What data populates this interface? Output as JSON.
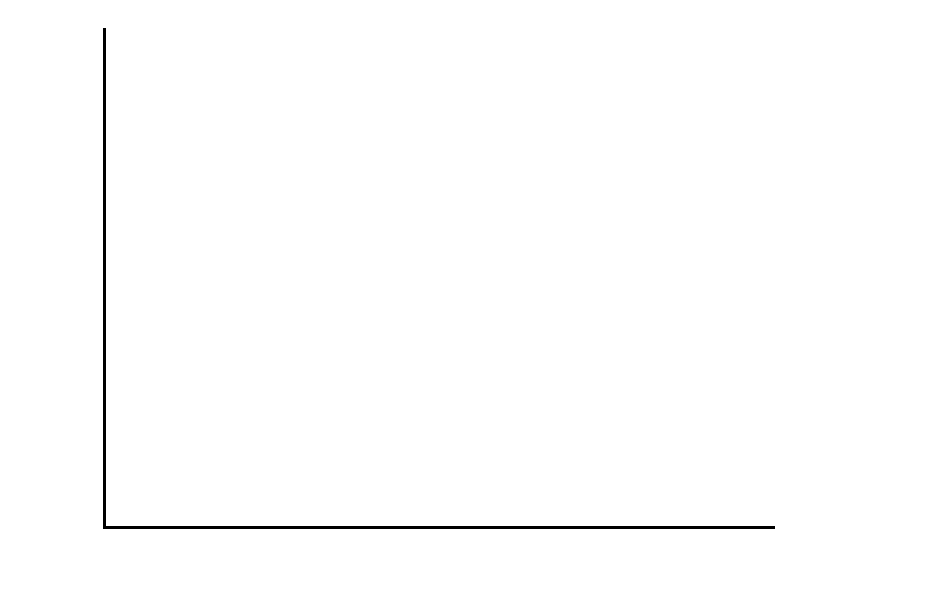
{
  "chart_data": {
    "type": "bar",
    "subtype": "stacked-vertical",
    "title": "",
    "xlabel": "Year",
    "ylabel": "",
    "categories": [
      "72",
      "73",
      "74",
      "75",
      "76",
      "77",
      "78",
      "79",
      "80",
      "81",
      "82",
      "83",
      "84",
      "85"
    ],
    "ylim": [
      0,
      600000
    ],
    "yticks": [
      0,
      100000,
      200000,
      300000,
      400000,
      500000,
      600000
    ],
    "ytick_labels": [
      "0",
      "100,000",
      "200,000",
      "300,000",
      "400,000",
      "500,000",
      "600,000"
    ],
    "grid": false,
    "legend_position": "right",
    "series": [
      {
        "name": "Sales—Product Franchising",
        "stack_position": "bottom",
        "values": [
          109000,
          122000,
          121000,
          147000,
          168000,
          195000,
          218000,
          241000,
          252000,
          277000,
          277000,
          319000,
          357000,
          381000
        ]
      },
      {
        "name": "Sales—Pure Franchising",
        "stack_position": "top",
        "values": [
          29000,
          36000,
          42000,
          42000,
          54000,
          66000,
          64000,
          77000,
          87000,
          88000,
          97000,
          110000,
          124000,
          152000
        ]
      }
    ],
    "totals": [
      138000,
      158000,
      163000,
      189000,
      222000,
      261000,
      282000,
      318000,
      339000,
      365000,
      374000,
      429000,
      481000,
      533000
    ]
  },
  "legend": {
    "entries": [
      {
        "label": "Sales—\nPure\nFranchising",
        "swatch_color": "#a5a5a5"
      },
      {
        "label": "Sales—\nProduct\nFranchising",
        "swatch_color": "#a5a5a5"
      }
    ]
  },
  "colors": {
    "bar_fill": "#a5a5a5",
    "bar_outline": "#000000",
    "axis": "#000000",
    "background": "#ffffff",
    "text": "#000000"
  }
}
